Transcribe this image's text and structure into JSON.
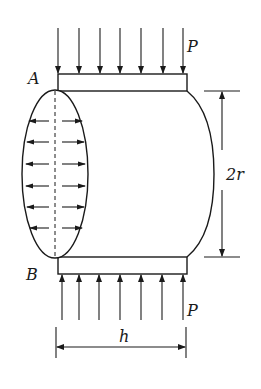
{
  "diagram": {
    "labels": {
      "point_top": "A",
      "point_bottom": "B",
      "load_top": "P",
      "load_bottom": "P",
      "diameter": "2r",
      "length": "h"
    },
    "load_arrows": {
      "top_count": 7,
      "bottom_count": 7,
      "direction_top": "down",
      "direction_bottom": "up"
    },
    "pressure_arrows": {
      "rows": 6,
      "pairs_per_row": 2,
      "direction": "outward"
    },
    "colors": {
      "stroke": "#1a1a1a",
      "background": "#ffffff"
    }
  }
}
